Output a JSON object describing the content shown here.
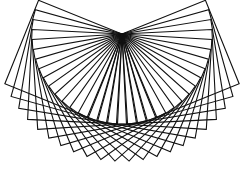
{
  "figure": {
    "background_color": "#ffffff",
    "stroke_color": "#111111"
  },
  "chart_data": {
    "type": "diagram",
    "title": "",
    "shape": "square",
    "pivot": [
      122,
      34
    ],
    "side_length": 90,
    "start_angle_deg": -22,
    "end_angle_deg": 112,
    "count": 22
  }
}
